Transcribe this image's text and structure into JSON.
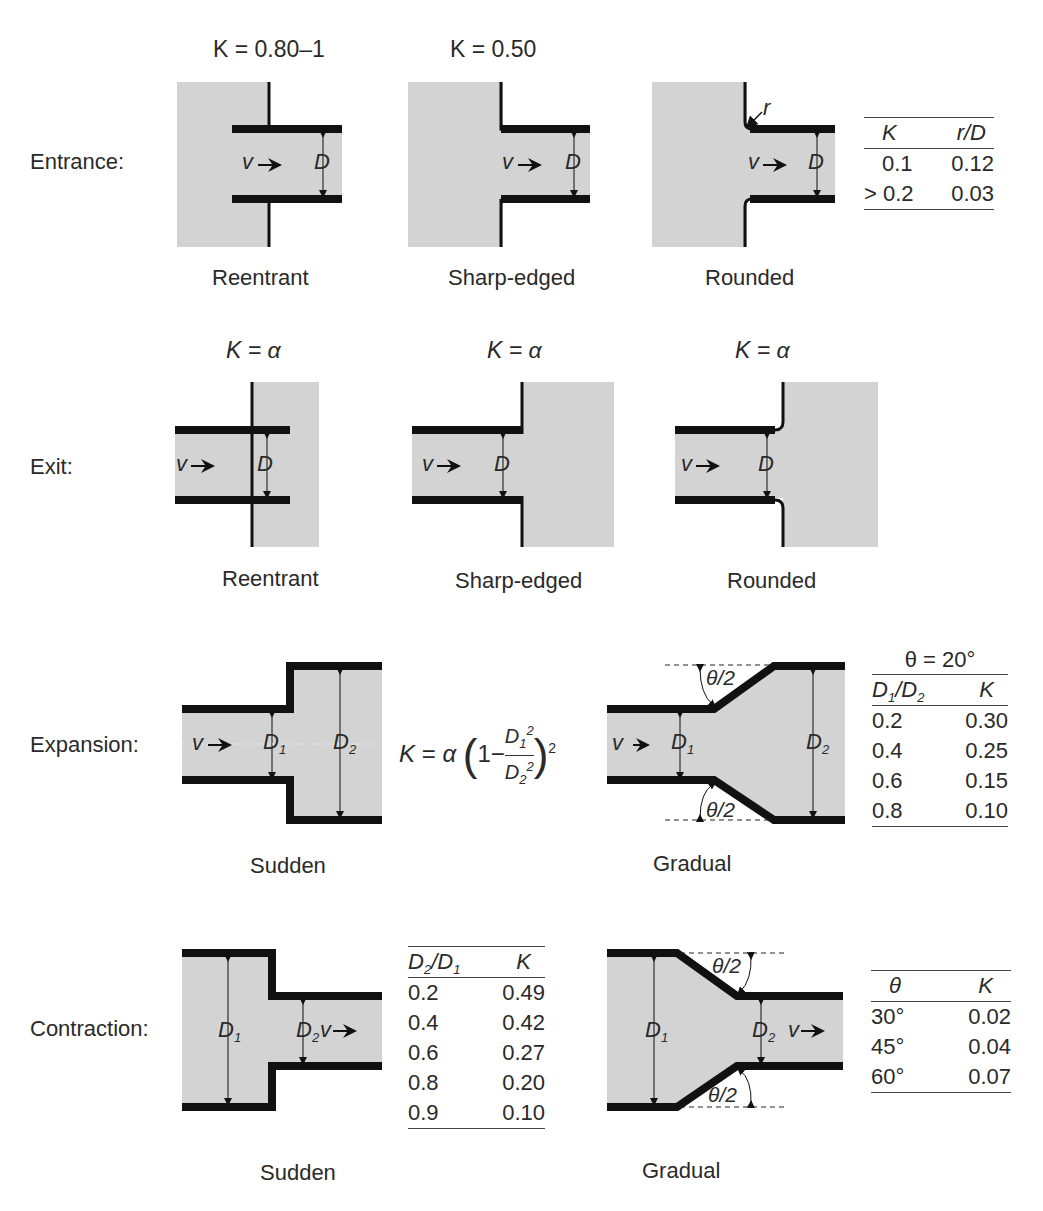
{
  "rows": {
    "entrance": {
      "label": "Entrance:",
      "cases": [
        {
          "k_label": "K = 0.80–1",
          "name": "Reentrant"
        },
        {
          "k_label": "K = 0.50",
          "name": "Sharp-edged"
        },
        {
          "k_label": "",
          "name": "Rounded"
        }
      ],
      "table": {
        "headers": [
          "K",
          "r/D"
        ],
        "rows": [
          [
            "0.1",
            "0.12"
          ],
          [
            "> 0.2",
            "0.03"
          ]
        ]
      }
    },
    "exit": {
      "label": "Exit:",
      "cases": [
        {
          "k_label": "K = α",
          "name": "Reentrant"
        },
        {
          "k_label": "K = α",
          "name": "Sharp-edged"
        },
        {
          "k_label": "K = α",
          "name": "Rounded"
        }
      ]
    },
    "expansion": {
      "label": "Expansion:",
      "cases": [
        {
          "name": "Sudden"
        },
        {
          "name": "Gradual"
        }
      ],
      "formula": "K = α (1 − D1²/D2²)²",
      "table": {
        "title": "θ = 20°",
        "headers": [
          "D1/D2",
          "K"
        ],
        "rows": [
          [
            "0.2",
            "0.30"
          ],
          [
            "0.4",
            "0.25"
          ],
          [
            "0.6",
            "0.15"
          ],
          [
            "0.8",
            "0.10"
          ]
        ]
      }
    },
    "contraction": {
      "label": "Contraction:",
      "cases": [
        {
          "name": "Sudden"
        },
        {
          "name": "Gradual"
        }
      ],
      "sudden_table": {
        "headers": [
          "D2/D1",
          "K"
        ],
        "rows": [
          [
            "0.2",
            "0.49"
          ],
          [
            "0.4",
            "0.42"
          ],
          [
            "0.6",
            "0.27"
          ],
          [
            "0.8",
            "0.20"
          ],
          [
            "0.9",
            "0.10"
          ]
        ]
      },
      "gradual_table": {
        "headers": [
          "θ",
          "K"
        ],
        "rows": [
          [
            "30°",
            "0.02"
          ],
          [
            "45°",
            "0.04"
          ],
          [
            "60°",
            "0.07"
          ]
        ]
      }
    }
  },
  "symbols": {
    "velocity": "v",
    "diameter": "D",
    "radius": "r",
    "half_angle": "θ/2",
    "d1": "D",
    "d2": "D",
    "sub1": "1",
    "sub2": "2"
  },
  "colors": {
    "fluid": "#d3d3d3",
    "wall": "#111111",
    "text": "#2a2a2a"
  }
}
